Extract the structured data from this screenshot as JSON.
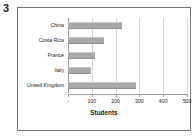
{
  "figure": {
    "number": "3"
  },
  "chart_data": {
    "type": "bar",
    "orientation": "horizontal",
    "title": "",
    "subtitle": "",
    "xlabel": "Students",
    "ylabel": "",
    "categories": [
      "China",
      "Costa Rica",
      "France",
      "Italy",
      "United Kingdom"
    ],
    "values": [
      225,
      150,
      115,
      95,
      285
    ],
    "series": [
      {
        "name": "Students",
        "values": [
          225,
          150,
          115,
          95,
          285
        ]
      }
    ],
    "xlim": [
      0,
      500
    ],
    "xticks": [
      0,
      100,
      200,
      300,
      400,
      500
    ],
    "xtick_labels": [
      "-",
      "100",
      "200",
      "300",
      "400",
      "500"
    ],
    "grid": true,
    "grid_axis": "x",
    "legend": false,
    "legend_position": "none",
    "bar_color": "#a9a9a9",
    "gridline_color": "#d4d4d4",
    "axis_color": "#9a9a9a",
    "text_color": "#1a1a1a",
    "background_color": "#ffffff",
    "border_color": "#7a7a7a"
  }
}
